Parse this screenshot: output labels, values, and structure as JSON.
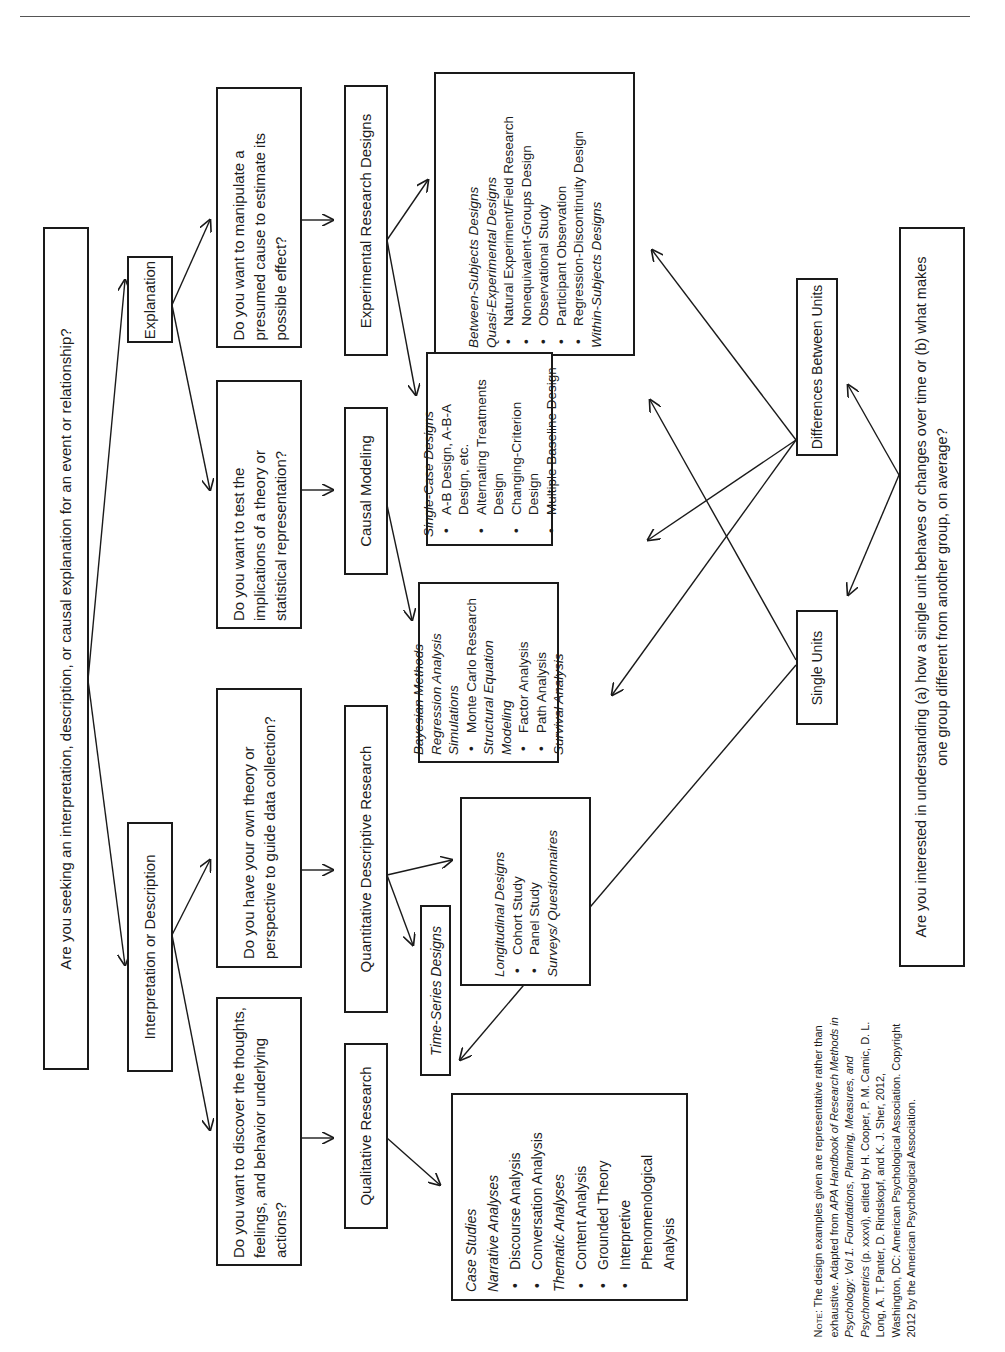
{
  "page": {
    "orientation": "rotated-90-ccw",
    "rule_color": "#555555",
    "box_border_color": "#1a1a1a"
  },
  "root": {
    "text": "Are you seeking an interpretation, description, or causal explanation for an event or relationship?"
  },
  "level1": {
    "explanation": "Explanation",
    "interpretation": "Interpretation or Description"
  },
  "questions": {
    "manipulate": "Do you want to manipulate a presumed cause to estimate its possible effect?",
    "test": "Do you want to test the implications of a theory or statistical representation?",
    "own_theory": "Do you have your own theory or perspective to guide data collection?",
    "discover": "Do you want to discover the thoughts, feelings, and behavior underlying actions?"
  },
  "research_types": {
    "experimental": "Experimental Research Designs",
    "causal": "Causal Modeling",
    "quant_desc": "Quantitative Descriptive Research",
    "qualitative": "Qualitative Research"
  },
  "designs": {
    "between": {
      "items": [
        {
          "type": "heading",
          "text": "Between-Subjects Designs"
        },
        {
          "type": "heading",
          "text": "Quasi-Experimental Designs"
        },
        {
          "type": "bullet",
          "text": "Natural Experiment/Field Research"
        },
        {
          "type": "bullet",
          "text": "Nonequivalent-Groups Design"
        },
        {
          "type": "bullet",
          "text": "Observational  Study"
        },
        {
          "type": "bullet",
          "text": "Participant Observation"
        },
        {
          "type": "bullet",
          "text": "Regression-Discontinuity Design"
        },
        {
          "type": "heading",
          "text": "Within-Subjects Designs"
        }
      ]
    },
    "single_case": {
      "items": [
        {
          "type": "heading",
          "text": "Single-Case Designs"
        },
        {
          "type": "bullet",
          "text": "A-B Design, A-B-A Design, etc."
        },
        {
          "type": "bullet",
          "text": "Alternating Treatments Design"
        },
        {
          "type": "bullet",
          "text": "Changing-Criterion Design"
        },
        {
          "type": "bullet",
          "text": "Multiple Baseline Design"
        }
      ]
    },
    "causal_methods": {
      "items": [
        {
          "type": "heading",
          "text": "Bayesian Methods"
        },
        {
          "type": "heading",
          "text": "Regression Analysis"
        },
        {
          "type": "heading",
          "text": "Simulations"
        },
        {
          "type": "bullet",
          "text": "Monte Carlo Research"
        },
        {
          "type": "heading",
          "text": "Structural Equation Modeling"
        },
        {
          "type": "bullet",
          "text": "Factor Analysis"
        },
        {
          "type": "bullet",
          "text": "Path Analysis"
        },
        {
          "type": "heading",
          "text": "Survival Analysis"
        }
      ]
    },
    "longitudinal": {
      "items": [
        {
          "type": "heading",
          "text": "Longitudinal Designs"
        },
        {
          "type": "bullet",
          "text": "Cohort Study"
        },
        {
          "type": "bullet",
          "text": "Panel Study"
        },
        {
          "type": "heading",
          "text": "Surveys/ Questionnaires"
        }
      ]
    },
    "time_series": {
      "text": "Time-Series Designs"
    },
    "qualitative_methods": {
      "items": [
        {
          "type": "heading",
          "text": "Case Studies"
        },
        {
          "type": "heading",
          "text": "Narrative Analyses"
        },
        {
          "type": "bullet",
          "text": "Discourse Analysis"
        },
        {
          "type": "bullet",
          "text": "Conversation Analysis"
        },
        {
          "type": "heading",
          "text": "Thematic Analyses"
        },
        {
          "type": "bullet",
          "text": "Content Analysis"
        },
        {
          "type": "bullet",
          "text": "Grounded Theory"
        },
        {
          "type": "bullet",
          "text": "Interpretive Phenomenological Analysis"
        }
      ]
    }
  },
  "units": {
    "differences": "Differences Between Units",
    "single": "Single Units",
    "question": "Are you interested in understanding (a) how a single unit behaves or changes over time or (b) what makes one group different from another group, on average?"
  },
  "note": {
    "label": "Note:",
    "line1": "The design examples given are representative rather than exhaustive.",
    "adapted_prefix": "Adapted from ",
    "book_title": "APA Handbook of Research Methods in Psychology: Vol 1. Foundations, Planning, Measures, and Psychometrics",
    "pages": "(p. xxxvi), edited by H. Cooper, P. M. Camic, D. L. Long, A. T. Panter, D. Rindskopf, and K. J. Sher, 2012, Washington, DC: American Psychological Association. Copyright 2012 by the American Psychological Association."
  }
}
